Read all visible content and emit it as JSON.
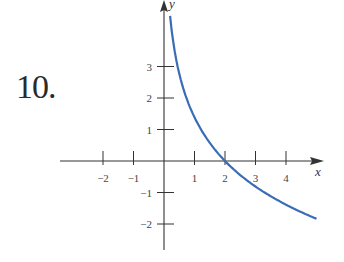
{
  "problem": {
    "number": "10."
  },
  "colors": {
    "curve": "#3a6db5",
    "axis": "#333333"
  },
  "chart_data": {
    "type": "line",
    "title": "",
    "xlabel": "x",
    "ylabel": "y",
    "xlim": [
      -2.2,
      5.3
    ],
    "ylim": [
      -2.9,
      5.1
    ],
    "x_ticks": [
      -2,
      -1,
      1,
      2,
      3,
      4
    ],
    "x_tick_labels": [
      "−2",
      "−1",
      "1",
      "2",
      "3",
      "4"
    ],
    "y_ticks": [
      3,
      2,
      1,
      -1,
      -2
    ],
    "y_tick_labels": [
      "3",
      "2",
      "1",
      "−1",
      "−2"
    ],
    "grid": false,
    "legend": null,
    "series": [
      {
        "name": "curve",
        "description": "decreasing logarithmic curve crossing x-axis at (2, 0), approx y = -2 ln(x/2)",
        "x": [
          0.2,
          0.3,
          0.5,
          0.75,
          1,
          1.5,
          2,
          2.5,
          3,
          3.5,
          4,
          4.5,
          5
        ],
        "y": [
          4.6,
          3.79,
          2.77,
          1.96,
          1.39,
          0.58,
          0,
          -0.45,
          -0.81,
          -1.12,
          -1.39,
          -1.62,
          -1.83
        ]
      }
    ],
    "annotations": [
      {
        "text": "10.",
        "role": "problem number"
      }
    ]
  }
}
